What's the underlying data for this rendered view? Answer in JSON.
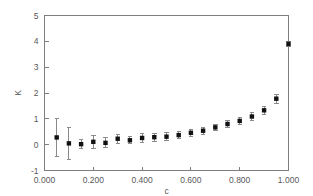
{
  "chart_data": {
    "type": "scatter",
    "title": "",
    "xlabel": "c",
    "ylabel": "K",
    "xlim": [
      0.0,
      1.0
    ],
    "ylim": [
      -1,
      5
    ],
    "grid": false,
    "legend": false,
    "xticks": [
      0.0,
      0.2,
      0.4,
      0.6,
      0.8,
      1.0
    ],
    "xtick_labels": [
      "0.000",
      "0.200",
      "0.400",
      "0.600",
      "0.800",
      "1.000"
    ],
    "yticks": [
      -1,
      0,
      1,
      2,
      3,
      4,
      5
    ],
    "ytick_labels": [
      "-1",
      "0",
      "1",
      "2",
      "3",
      "4",
      "5"
    ],
    "marker": "square",
    "marker_color": "#111113",
    "errorbar_color": "#8a8a8c",
    "x": [
      0.05,
      0.1,
      0.15,
      0.2,
      0.25,
      0.3,
      0.35,
      0.4,
      0.45,
      0.5,
      0.55,
      0.6,
      0.65,
      0.7,
      0.75,
      0.8,
      0.85,
      0.9,
      0.95,
      1.0
    ],
    "y": [
      0.28,
      0.05,
      0.02,
      0.11,
      0.07,
      0.23,
      0.17,
      0.26,
      0.29,
      0.31,
      0.37,
      0.46,
      0.54,
      0.67,
      0.8,
      0.92,
      1.09,
      1.33,
      1.78,
      3.9
    ],
    "yerr": [
      0.72,
      0.62,
      0.18,
      0.26,
      0.19,
      0.17,
      0.14,
      0.18,
      0.15,
      0.16,
      0.15,
      0.13,
      0.13,
      0.13,
      0.14,
      0.14,
      0.17,
      0.15,
      0.18,
      0.09
    ]
  },
  "axes": {
    "x_axis_title": "c",
    "y_axis_title": "K"
  }
}
